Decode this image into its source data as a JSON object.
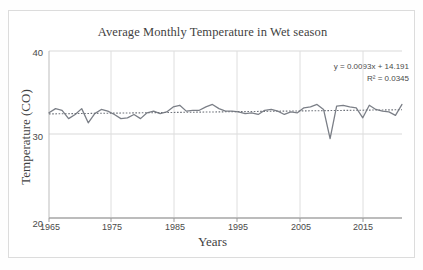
{
  "chart_data": {
    "type": "line",
    "title": "Average Monthly Temperature in Wet season",
    "xlabel": "Years",
    "ylabel": "Temperature (CO)",
    "xlim": [
      1965,
      2019
    ],
    "ylim": [
      20,
      40
    ],
    "xticks": [
      1965,
      1975,
      1985,
      1995,
      2005,
      2015
    ],
    "yticks": [
      20,
      30,
      40
    ],
    "grid": true,
    "legend_position": "none",
    "annotations": {
      "equation": "y = 0.0093x + 14.191",
      "r_squared": "R² = 0.0345"
    },
    "trendline": {
      "type": "linear",
      "style": "dotted",
      "slope": 0.0093,
      "intercept": 14.191,
      "r2": 0.0345
    },
    "series": [
      {
        "name": "Average Monthly Temperature in Wet season",
        "color": "#7b7f87",
        "x": [
          1965,
          1966,
          1967,
          1968,
          1969,
          1970,
          1971,
          1972,
          1973,
          1974,
          1975,
          1976,
          1977,
          1978,
          1979,
          1980,
          1981,
          1982,
          1983,
          1984,
          1985,
          1986,
          1987,
          1988,
          1989,
          1990,
          1991,
          1992,
          1993,
          1994,
          1995,
          1996,
          1997,
          1998,
          1999,
          2000,
          2001,
          2002,
          2003,
          2004,
          2005,
          2006,
          2007,
          2008,
          2009,
          2010,
          2011,
          2012,
          2013,
          2014,
          2015,
          2016,
          2017,
          2018,
          2019
        ],
        "values": [
          32.6,
          33.1,
          32.9,
          31.9,
          32.4,
          33.1,
          31.4,
          32.5,
          33.0,
          32.8,
          32.4,
          31.9,
          32.0,
          32.4,
          31.9,
          32.6,
          32.8,
          32.5,
          32.7,
          33.3,
          33.5,
          32.8,
          32.9,
          32.9,
          33.3,
          33.6,
          33.1,
          32.8,
          32.8,
          32.7,
          32.5,
          32.6,
          32.4,
          32.9,
          33.0,
          32.8,
          32.4,
          32.7,
          32.6,
          33.2,
          33.3,
          33.6,
          33.0,
          29.5,
          33.4,
          33.5,
          33.3,
          33.2,
          32.0,
          33.5,
          33.0,
          32.8,
          32.7,
          32.3,
          33.6
        ]
      }
    ]
  },
  "axes": {
    "y_tick_labels": [
      "40",
      "30",
      "20"
    ],
    "x_tick_labels": [
      "1965",
      "1975",
      "1985",
      "1995",
      "2005",
      "2015"
    ]
  }
}
